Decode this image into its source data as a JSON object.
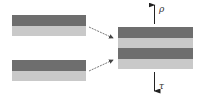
{
  "diagram": {
    "type": "layer-stacking",
    "colors": {
      "dark": "#6e6e6e",
      "light": "#c9c9c9",
      "arrow": "#444444",
      "background": "#ffffff"
    },
    "left_bilayers": [
      {
        "id": "top-bilayer",
        "layers": [
          "dark",
          "light"
        ]
      },
      {
        "id": "bottom-bilayer",
        "layers": [
          "dark",
          "light"
        ]
      }
    ],
    "result_stack": {
      "layers": [
        "dark",
        "light",
        "dark",
        "light"
      ]
    },
    "labels": {
      "up": "ρ",
      "down": "τ"
    }
  }
}
